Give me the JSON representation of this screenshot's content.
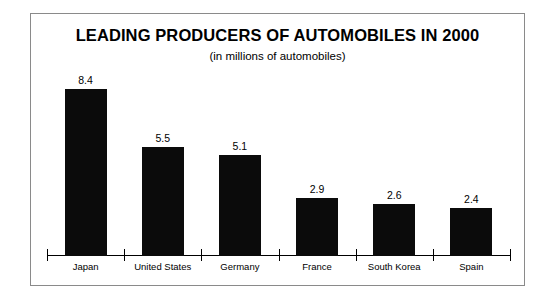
{
  "chart_data": {
    "type": "bar",
    "title": "LEADING PRODUCERS OF AUTOMOBILES IN 2000",
    "subtitle": "(in millions of automobiles)",
    "xlabel": "",
    "ylabel": "",
    "ylim": [
      0,
      8.4
    ],
    "grid": false,
    "legend": "none",
    "axis": {
      "baseline_visible": true,
      "tick_count": 7,
      "tick_style": "category-separator"
    },
    "bar_color": "#0b0b0b",
    "categories": [
      "Japan",
      "United States",
      "Germany",
      "France",
      "South Korea",
      "Spain"
    ],
    "values": [
      8.4,
      5.5,
      5.1,
      2.9,
      2.6,
      2.4
    ],
    "value_labels": [
      "8.4",
      "5.5",
      "5.1",
      "2.9",
      "2.6",
      "2.4"
    ],
    "bars": [
      {
        "category": "Japan",
        "value": 8.4,
        "label": "8.4"
      },
      {
        "category": "United States",
        "value": 5.5,
        "label": "5.5"
      },
      {
        "category": "Germany",
        "value": 5.1,
        "label": "5.1"
      },
      {
        "category": "France",
        "value": 2.9,
        "label": "2.9"
      },
      {
        "category": "South Korea",
        "value": 2.6,
        "label": "2.6"
      },
      {
        "category": "Spain",
        "value": 2.4,
        "label": "2.4"
      }
    ]
  },
  "colors": {
    "bar": "#0b0b0b",
    "frame": "#8a8a8a",
    "axis": "#000000",
    "background": "#ffffff",
    "text": "#000000"
  }
}
